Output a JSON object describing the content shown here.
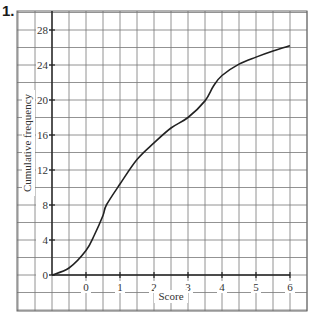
{
  "question_number": "1.",
  "chart_data": {
    "type": "line",
    "title": "",
    "xlabel": "Score",
    "ylabel": "Cumulative frequency",
    "x_ticks": [
      "0",
      "1",
      "2",
      "3",
      "4",
      "5",
      "6"
    ],
    "y_ticks": [
      "0",
      "4",
      "8",
      "12",
      "16",
      "20",
      "24",
      "28"
    ],
    "xlim": [
      -1,
      6
    ],
    "ylim": [
      0,
      28
    ],
    "grid": true,
    "series": [
      {
        "name": "Cumulative frequency",
        "x": [
          -1,
          -0.5,
          0,
          0.25,
          0.5,
          0.6,
          1,
          1.5,
          2,
          2.5,
          3,
          3.5,
          3.75,
          4,
          4.5,
          5,
          5.5,
          6
        ],
        "y": [
          0,
          0.8,
          2.8,
          4.6,
          6.8,
          8,
          10.4,
          13.2,
          15.1,
          16.8,
          18.0,
          19.9,
          21.6,
          22.8,
          24.1,
          24.9,
          25.6,
          26.2
        ]
      }
    ]
  }
}
